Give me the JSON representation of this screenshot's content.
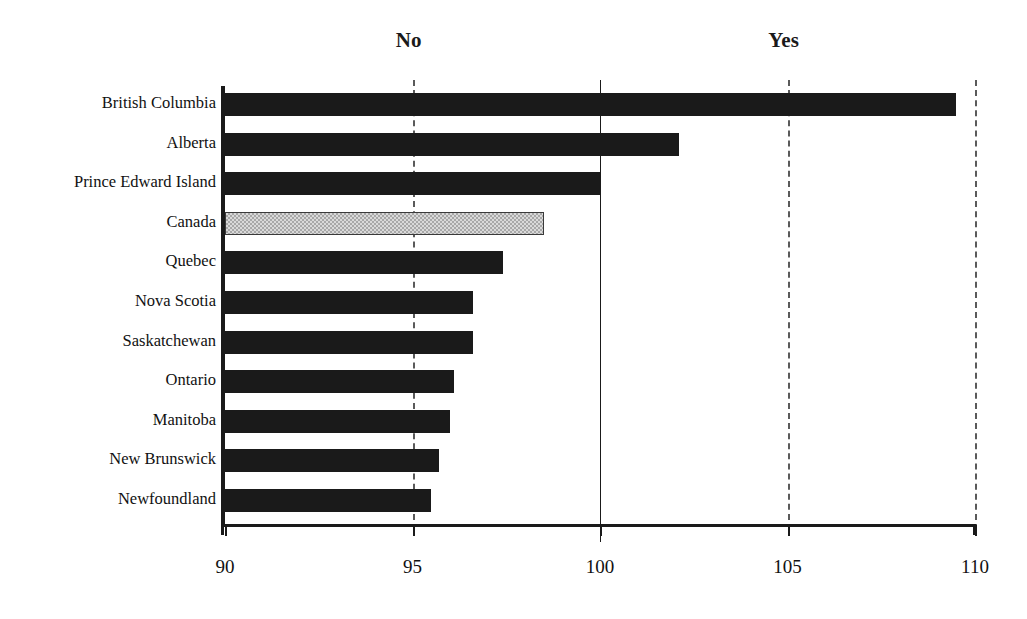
{
  "chart_data": {
    "type": "bar",
    "orientation": "horizontal",
    "title": "",
    "subtitle": "",
    "xlabel": "",
    "ylabel": "",
    "xlim": [
      90,
      110
    ],
    "xticks": [
      90,
      95,
      100,
      105,
      110
    ],
    "xtick_labels": [
      "90",
      "95",
      "100",
      "105",
      "110"
    ],
    "grid": true,
    "gridlines": [
      {
        "value": 95,
        "style": "dashed"
      },
      {
        "value": 100,
        "style": "solid"
      },
      {
        "value": 105,
        "style": "dashed"
      },
      {
        "value": 110,
        "style": "dashed"
      }
    ],
    "annotations": [
      {
        "text": "No",
        "x": 94.9
      },
      {
        "text": "Yes",
        "x": 104.9
      }
    ],
    "legend": "none",
    "categories": [
      "British Columbia",
      "Alberta",
      "Prince Edward Island",
      "Canada",
      "Quebec",
      "Nova Scotia",
      "Saskatchewan",
      "Ontario",
      "Manitoba",
      "New Brunswick",
      "Newfoundland"
    ],
    "values": [
      109.5,
      102.1,
      100.0,
      98.5,
      97.4,
      96.6,
      96.6,
      96.1,
      96.0,
      95.7,
      95.5
    ],
    "highlight_index": 3,
    "colors": {
      "bar": "#1a1a1a",
      "bar_highlight": "#d9d9d9",
      "axis": "#1a1a1a",
      "grid": "#5a5a5a",
      "background": "#ffffff",
      "text": "#111111"
    },
    "bars": [
      {
        "category": "British Columbia",
        "value": 109.5,
        "style": "solid-black"
      },
      {
        "category": "Alberta",
        "value": 102.1,
        "style": "solid-black"
      },
      {
        "category": "Prince Edward Island",
        "value": 100.0,
        "style": "solid-black"
      },
      {
        "category": "Canada",
        "value": 98.5,
        "style": "hatched-grey"
      },
      {
        "category": "Quebec",
        "value": 97.4,
        "style": "solid-black"
      },
      {
        "category": "Nova Scotia",
        "value": 96.6,
        "style": "solid-black"
      },
      {
        "category": "Saskatchewan",
        "value": 96.6,
        "style": "solid-black"
      },
      {
        "category": "Ontario",
        "value": 96.1,
        "style": "solid-black"
      },
      {
        "category": "Manitoba",
        "value": 96.0,
        "style": "solid-black"
      },
      {
        "category": "New Brunswick",
        "value": 95.7,
        "style": "solid-black"
      },
      {
        "category": "Newfoundland",
        "value": 95.5,
        "style": "solid-black"
      }
    ]
  }
}
